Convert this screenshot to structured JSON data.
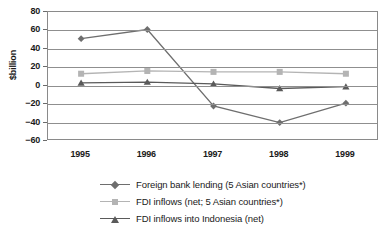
{
  "chart_data": {
    "type": "line",
    "title": "",
    "xlabel": "",
    "ylabel": "$billion",
    "categories": [
      "1995",
      "1996",
      "1997",
      "1998",
      "1999"
    ],
    "ylim": [
      -60,
      80
    ],
    "ytick_values": [
      80,
      60,
      40,
      20,
      0,
      -20,
      -40,
      -60
    ],
    "ytick_labels": [
      "80",
      "60",
      "40",
      "20",
      "0",
      "−20",
      "−40",
      "−60"
    ],
    "grid": true,
    "legend_position": "bottom",
    "series": [
      {
        "name": "Foreign bank lending (5 Asian countries*)",
        "marker": "diamond",
        "color": "#6e6e6e",
        "values": [
          51,
          61,
          -22,
          -40,
          -19
        ]
      },
      {
        "name": "FDI inflows (net; 5 Asian countries*)",
        "marker": "square",
        "color": "#b4b4b4",
        "values": [
          13,
          16,
          15,
          15,
          13
        ]
      },
      {
        "name": "FDI inflows into Indonesia (net)",
        "marker": "triangle",
        "color": "#5a5a5a",
        "values": [
          3,
          4,
          2,
          -3,
          -1
        ]
      }
    ]
  },
  "axis": {
    "y_title": "$billion"
  },
  "legend": {
    "items": [
      {
        "label": "Foreign bank lending (5 Asian countries*)"
      },
      {
        "label": "FDI inflows (net; 5 Asian countries*)"
      },
      {
        "label": "FDI inflows into Indonesia (net)"
      }
    ]
  },
  "colors": {
    "series_1": "#6e6e6e",
    "series_2": "#b4b4b4",
    "series_3": "#5a5a5a",
    "grid": "#8f8f8f",
    "frame": "#8a8a8a",
    "text": "#1a1a1a"
  }
}
